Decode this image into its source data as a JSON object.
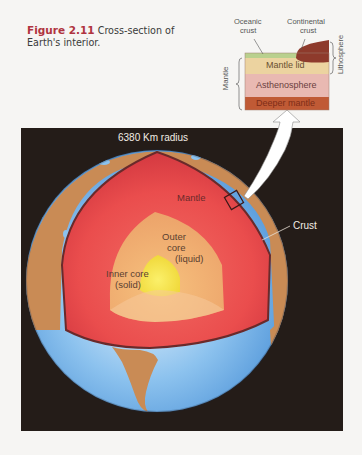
{
  "caption": {
    "figure_number": "Figure 2.11",
    "text": "Cross-section of Earth's interior."
  },
  "globe": {
    "radius_label": "6380 Km radius",
    "layers": [
      {
        "name": "Crust",
        "color": "#c98b55"
      },
      {
        "name": "Mantle",
        "color": "#e8464a"
      },
      {
        "name": "Outer core (liquid)",
        "color": "#f2b074"
      },
      {
        "name": "Inner core (solid)",
        "color": "#f5e23a"
      }
    ],
    "labels": {
      "mantle": "Mantle",
      "outer_core_line1": "Outer",
      "outer_core_line2": "core",
      "outer_core_line3": "(liquid)",
      "inner_core_line1": "Inner core",
      "inner_core_line2": "(solid)",
      "crust": "Crust"
    },
    "ocean_color": "#6fb0e6",
    "background_color": "#241c18"
  },
  "inset": {
    "top_labels": {
      "oceanic_crust_line1": "Oceanic",
      "oceanic_crust_line2": "crust",
      "continental_crust_line1": "Continental",
      "continental_crust_line2": "crust"
    },
    "layers": [
      {
        "name": "Mantle lid",
        "color": "#ecd3a0"
      },
      {
        "name": "Asthenosphere",
        "color": "#e9b9b2"
      },
      {
        "name": "Deeper mantle",
        "color": "#c05a35"
      }
    ],
    "oceanic_crust_color": "#b9d08e",
    "continental_crust_color": "#8e3a2c",
    "side_labels": {
      "mantle": "Mantle",
      "lithosphere": "Lithosphere"
    }
  }
}
